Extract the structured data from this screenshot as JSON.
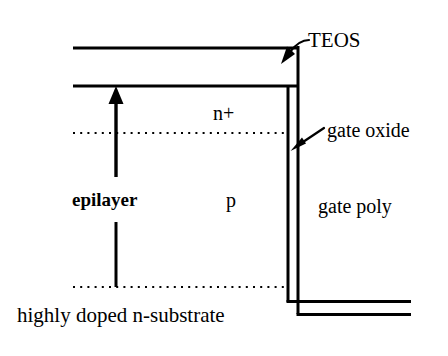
{
  "diagram": {
    "colors": {
      "line": "#000000",
      "background": "#ffffff",
      "text": "#000000"
    },
    "labels": {
      "teos": "TEOS",
      "gate_oxide": "gate oxide",
      "gate_poly": "gate poly",
      "n_plus": "n+",
      "p": "p",
      "epilayer": "epilayer",
      "substrate": "highly doped n-substrate"
    },
    "layers": [
      {
        "name": "TEOS",
        "label": "TEOS",
        "type": "dielectric"
      },
      {
        "name": "n-plus",
        "label": "n+",
        "type": "doped-region"
      },
      {
        "name": "p-body",
        "label": "p",
        "type": "doped-region"
      },
      {
        "name": "epilayer",
        "label": "epilayer",
        "type": "epitaxial-layer"
      },
      {
        "name": "substrate",
        "label": "highly doped n-substrate",
        "type": "substrate"
      },
      {
        "name": "gate-oxide",
        "label": "gate oxide",
        "type": "dielectric"
      },
      {
        "name": "gate-poly",
        "label": "gate poly",
        "type": "conductor"
      }
    ],
    "annotations": [
      {
        "name": "teos-arrow",
        "target": "TEOS",
        "style": "curved-arrow"
      },
      {
        "name": "gate-oxide-arrow",
        "target": "gate oxide",
        "style": "straight-arrow"
      },
      {
        "name": "epilayer-extent-arrow",
        "target": "epilayer",
        "style": "double-ended-extent"
      }
    ]
  }
}
